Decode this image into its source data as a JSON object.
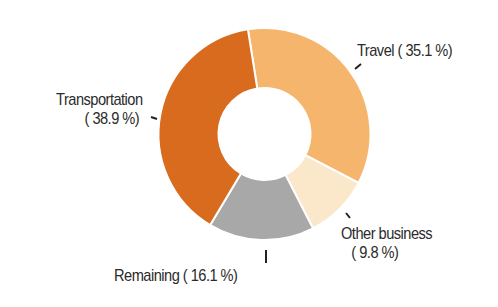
{
  "chart_data": {
    "type": "pie",
    "subtype": "donut",
    "title": "",
    "categories": [
      "Travel",
      "Other business",
      "Remaining",
      "Transportation"
    ],
    "values": [
      35.1,
      9.8,
      16.1,
      38.9
    ],
    "unit": "%",
    "colors": [
      "#F6B56C",
      "#FBE8CA",
      "#A8A8A8",
      "#D86B1D"
    ],
    "start_angle_deg": 351,
    "direction": "clockwise",
    "center": [
      264.5,
      134
    ],
    "outer_radius": 106,
    "inner_radius": 46,
    "separator_color": "#FFFFFF",
    "legend": "none (direct labels with leader ticks)"
  },
  "labels": {
    "travel": {
      "line1": "Travel ( 35.1 %)"
    },
    "transportation": {
      "line1": "Transportation",
      "line2": "( 38.9 %)"
    },
    "other": {
      "line1": "Other business",
      "line2": "(  9.8 %)"
    },
    "remaining": {
      "line1": "Remaining ( 16.1 %)"
    }
  },
  "ticks": [
    {
      "name": "travel-tick",
      "x1": 355,
      "y1": 69,
      "x2": 361,
      "y2": 64
    },
    {
      "name": "transportation-tick",
      "x1": 151,
      "y1": 117,
      "x2": 157,
      "y2": 119
    },
    {
      "name": "other-business-tick",
      "x1": 346,
      "y1": 213,
      "x2": 350,
      "y2": 218
    },
    {
      "name": "remaining-tick",
      "x1": 266,
      "y1": 250,
      "x2": 266,
      "y2": 263
    }
  ]
}
